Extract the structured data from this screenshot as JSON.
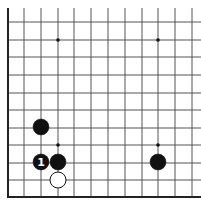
{
  "board": {
    "grid_color": "#555555",
    "edge_color": "#222222",
    "vertical_lines_x": [
      24,
      41,
      58,
      74,
      91,
      108,
      125,
      142,
      158,
      175,
      192
    ],
    "horizontal_lines_y": [
      22,
      40,
      57,
      75,
      93,
      110,
      128,
      145,
      163,
      180
    ],
    "left_edge_x": 8,
    "bottom_edge_y": 197,
    "top_y": 8,
    "right_x": 201,
    "hoshi": [
      {
        "x": 58,
        "y": 40
      },
      {
        "x": 158,
        "y": 40
      },
      {
        "x": 58,
        "y": 145
      },
      {
        "x": 158,
        "y": 145
      }
    ]
  },
  "stones": [
    {
      "color": "black",
      "x": 41,
      "y": 127,
      "label": ""
    },
    {
      "color": "black",
      "x": 41,
      "y": 162,
      "label": "1"
    },
    {
      "color": "black",
      "x": 58,
      "y": 162,
      "label": ""
    },
    {
      "color": "white",
      "x": 58,
      "y": 180,
      "label": ""
    },
    {
      "color": "black",
      "x": 158,
      "y": 162,
      "label": ""
    }
  ],
  "stone_radius": 8
}
